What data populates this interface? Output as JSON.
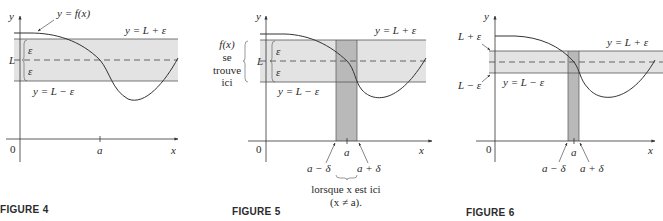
{
  "figures": [
    {
      "caption": "FIGURE 4",
      "labels": {
        "y_axis": "y",
        "x_axis": "x",
        "origin": "0",
        "a": "a",
        "L": "L",
        "eps_upper": "ε",
        "eps_lower": "ε",
        "curve": "y = f(x)",
        "upper_line": "y = L + ε",
        "lower_line": "y = L − ε"
      }
    },
    {
      "caption": "FIGURE 5",
      "labels": {
        "y_axis": "y",
        "x_axis": "x",
        "origin": "0",
        "a": "a",
        "L": "L",
        "eps_upper": "ε",
        "eps_lower": "ε",
        "upper_line": "y = L + ε",
        "lower_line": "y = L − ε",
        "fx_note": [
          "f(x)",
          "se",
          "trouve",
          "ici"
        ],
        "a_minus_delta": "a − δ",
        "a_plus_delta": "a + δ",
        "x_note_1": "lorsque x est ici",
        "x_note_2": "(x ≠ a)."
      }
    },
    {
      "caption": "FIGURE 6",
      "labels": {
        "y_axis": "y",
        "x_axis": "x",
        "origin": "0",
        "a": "a",
        "L_plus_eps": "L + ε",
        "L_minus_eps": "L − ε",
        "upper_line": "y = L + ε",
        "lower_line": "y = L − ε",
        "a_minus_delta": "a − δ",
        "a_plus_delta": "a + δ"
      }
    }
  ],
  "colors": {
    "band": "#e3e3e3",
    "strip": "#b9b9b9",
    "line": "#3a3a3a"
  }
}
